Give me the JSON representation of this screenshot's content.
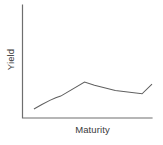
{
  "chart_data": {
    "type": "line",
    "title": "",
    "subtitle": "",
    "xlabel": "Maturity",
    "ylabel": "Yield",
    "grid": false,
    "legend": false,
    "legend_position": "none",
    "axis_ticks": false,
    "tick_labels_x": [],
    "tick_labels_y": [],
    "xlim": [
      0,
      100
    ],
    "ylim": [
      0,
      100
    ],
    "series": [
      {
        "name": "yield-curve",
        "color": "#5f5f5f",
        "x": [
          4.8,
          11.2,
          17.6,
          22.4,
          26.4,
          45.6,
          53.6,
          70.4,
          92.0,
          100.0
        ],
        "y": [
          14.2,
          21.4,
          28.0,
          32.1,
          34.8,
          57.1,
          51.8,
          43.8,
          38.4,
          53.6
        ]
      }
    ],
    "annotations": []
  },
  "axes": {
    "x_axis_name": "x-axis",
    "y_axis_name": "y-axis",
    "color": "#6e6e6e"
  },
  "colors": {
    "background": "#ffffff",
    "axis": "#6e6e6e",
    "line": "#5f5f5f",
    "label_text": "#3a3a3a"
  }
}
